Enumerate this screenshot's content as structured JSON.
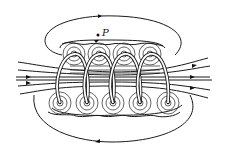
{
  "figure": {
    "point_label": "P",
    "colors": {
      "ink": "#1a1a1a",
      "background": "#ffffff"
    },
    "coil": {
      "turns_top": 4,
      "turns_bottom": 5
    },
    "field_direction": "left-to-right"
  }
}
